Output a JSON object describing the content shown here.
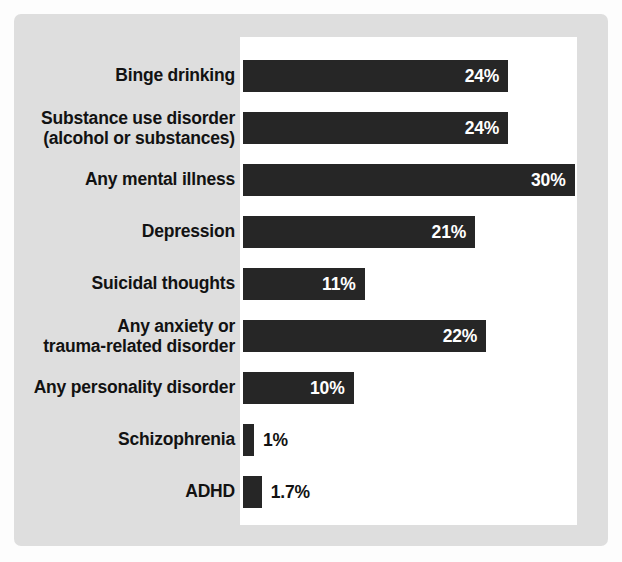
{
  "chart_data": {
    "type": "bar",
    "orientation": "horizontal",
    "title": "",
    "subtitle": "",
    "xlabel": "",
    "ylabel": "",
    "xlim": [
      0,
      31
    ],
    "grid": false,
    "legend": null,
    "value_suffix": "%",
    "categories": [
      "Binge drinking",
      "Substance use disorder\n(alcohol or substances)",
      "Any mental illness",
      "Depression",
      "Suicidal thoughts",
      "Any anxiety or\ntrauma-related disorder",
      "Any personality disorder",
      "Schizophrenia",
      "ADHD"
    ],
    "values": [
      24,
      24,
      30,
      21,
      11,
      22,
      10,
      1,
      1.7
    ],
    "value_labels": [
      "24%",
      "24%",
      "30%",
      "21%",
      "22%",
      "11%",
      "10%",
      "1%",
      "1.7%"
    ],
    "bars": [
      {
        "label": "Binge drinking",
        "value": 24,
        "value_label": "24%",
        "label_position": "inside"
      },
      {
        "label": "Substance use disorder\n(alcohol or substances)",
        "value": 24,
        "value_label": "24%",
        "label_position": "inside"
      },
      {
        "label": "Any mental illness",
        "value": 30,
        "value_label": "30%",
        "label_position": "inside"
      },
      {
        "label": "Depression",
        "value": 21,
        "value_label": "21%",
        "label_position": "inside"
      },
      {
        "label": "Suicidal thoughts",
        "value": 11,
        "value_label": "11%",
        "label_position": "inside"
      },
      {
        "label": "Any anxiety or\ntrauma-related disorder",
        "value": 22,
        "value_label": "22%",
        "label_position": "inside"
      },
      {
        "label": "Any personality disorder",
        "value": 10,
        "value_label": "10%",
        "label_position": "inside"
      },
      {
        "label": "Schizophrenia",
        "value": 1,
        "value_label": "1%",
        "label_position": "outside"
      },
      {
        "label": "ADHD",
        "value": 1.7,
        "value_label": "1.7%",
        "label_position": "outside"
      }
    ],
    "colors": {
      "bar": "#262626",
      "inside_label": "#ffffff",
      "outside_label": "#121212",
      "category_label": "#121212",
      "plot_background": "#ffffff",
      "card_background": "#dedede",
      "page_background": "#fdfdfd"
    }
  }
}
